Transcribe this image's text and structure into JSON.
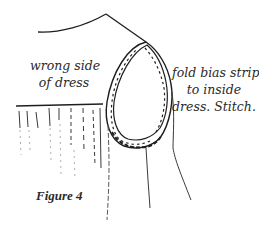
{
  "figure": {
    "caption": "Figure 4",
    "labels": {
      "wrong_side": [
        "wrong side",
        "of dress"
      ],
      "fold_instruction": [
        "fold bias strip",
        "to inside",
        "dress. Stitch."
      ]
    },
    "colors": {
      "ink": "#1e1e1e",
      "faint_ink": "#8a8a8a",
      "background": "#ffffff"
    }
  }
}
